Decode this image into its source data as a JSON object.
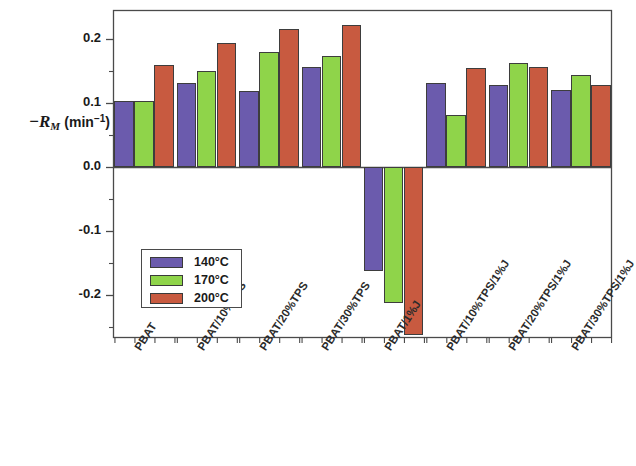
{
  "chart_data": {
    "type": "bar",
    "title": "",
    "xlabel": "",
    "ylabel": "-R_M (min^-1)",
    "ylabel_parts": {
      "minus": "−",
      "symbol": "R",
      "subscript": "M",
      "units_open": "(min",
      "units_exp": "−1",
      "units_close": ")"
    },
    "categories": [
      "PBAT",
      "PBAT/10%TPS",
      "PBAT/20%TPS",
      "PBAT/30%TPS",
      "PBAT/1%J",
      "PBAT/10%TPS/1%J",
      "PBAT/20%TPS/1%J",
      "PBAT/30%TPS/1%J"
    ],
    "series": [
      {
        "name": "140°C",
        "color": "#6B5BAD",
        "values": [
          0.103,
          0.132,
          0.119,
          0.157,
          -0.163,
          0.131,
          0.128,
          0.12
        ]
      },
      {
        "name": "170°C",
        "color": "#8FD44A",
        "values": [
          0.103,
          0.15,
          0.179,
          0.173,
          -0.212,
          0.081,
          0.163,
          0.143
        ]
      },
      {
        "name": "200°C",
        "color": "#C85A40",
        "values": [
          0.16,
          0.193,
          0.215,
          0.222,
          -0.262,
          0.154,
          0.157,
          0.128
        ]
      }
    ],
    "ylim": [
      -0.25,
      0.245
    ],
    "yticks": [
      0.2,
      0.1,
      0.0,
      -0.1,
      -0.2
    ],
    "ytick_labels": [
      "0.2",
      "0.1",
      "0.0",
      "-0.1",
      "-0.2"
    ],
    "grid": false,
    "legend": {
      "position": "lower-left-inside",
      "entries": [
        "140°C",
        "170°C",
        "200°C"
      ]
    },
    "axis_color": "#4a4a4a",
    "bar_edge_color": "#3d3d3d"
  }
}
